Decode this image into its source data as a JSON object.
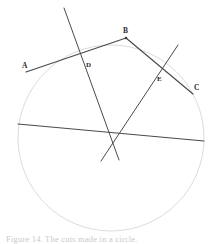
{
  "figure": {
    "caption": "Figure 14. The cuts made in a circle.",
    "background_color": "#ffffff",
    "circle_color": "#dcdcdc",
    "line_color": "#4a4a4a",
    "label_color": "#2b2b2b",
    "canvas": {
      "width": 212,
      "height": 244
    }
  },
  "circle": {
    "name": "main-circle",
    "cx": 111,
    "cy": 138,
    "r": 93,
    "stroke": "#dcdcdc",
    "stroke_width": 1
  },
  "points": [
    {
      "id": "A",
      "label": "A",
      "x": 26,
      "y": 72,
      "label_x": 22,
      "label_y": 62
    },
    {
      "id": "B",
      "label": "B",
      "x": 126,
      "y": 38,
      "label_x": 123,
      "label_y": 27
    },
    {
      "id": "C",
      "label": "C",
      "x": 193,
      "y": 94,
      "label_x": 194,
      "label_y": 84
    },
    {
      "id": "D",
      "label": "D",
      "x": 88,
      "y": 62,
      "label_x": 86,
      "label_y": 62
    },
    {
      "id": "E",
      "label": "E",
      "x": 158,
      "y": 77,
      "label_x": 157,
      "label_y": 76
    }
  ],
  "segments": [
    {
      "id": "chord-AB",
      "name": "chord-a-b",
      "from": {
        "x": 26,
        "y": 72
      },
      "to": {
        "x": 126,
        "y": 38
      },
      "stroke": "#4a4a4a",
      "stroke_width": 1.15
    },
    {
      "id": "chord-BC",
      "name": "chord-b-c",
      "from": {
        "x": 126,
        "y": 38
      },
      "to": {
        "x": 193,
        "y": 94
      },
      "stroke": "#4a4a4a",
      "stroke_width": 1.15
    },
    {
      "id": "transversal-1",
      "name": "transversal-through-d",
      "from": {
        "x": 64,
        "y": 8
      },
      "to": {
        "x": 119,
        "y": 160
      },
      "stroke": "#4a4a4a",
      "stroke_width": 1.0
    },
    {
      "id": "transversal-2",
      "name": "transversal-through-e",
      "from": {
        "x": 178,
        "y": 45
      },
      "to": {
        "x": 101,
        "y": 161
      },
      "stroke": "#4a4a4a",
      "stroke_width": 1.0
    },
    {
      "id": "chord-horizontal",
      "name": "horizontal-chord",
      "from": {
        "x": 18,
        "y": 124
      },
      "to": {
        "x": 204,
        "y": 141
      },
      "stroke": "#4a4a4a",
      "stroke_width": 1.15
    }
  ],
  "intersection_center": {
    "name": "center-intersection",
    "x": 110,
    "y": 136
  }
}
